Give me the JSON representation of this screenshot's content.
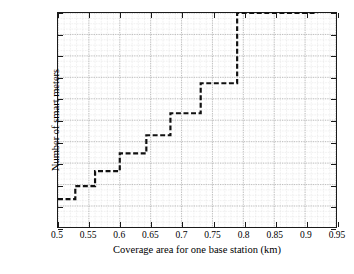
{
  "chart_data": {
    "type": "line",
    "subtype": "step",
    "title": "",
    "xlabel": "Coverage area for one base station (km)",
    "ylabel": "Number of smart meters",
    "xlim": [
      0.5,
      0.95
    ],
    "ylim": [
      600,
      2600
    ],
    "xticks": [
      0.5,
      0.55,
      0.6,
      0.65,
      0.7,
      0.75,
      0.8,
      0.85,
      0.9,
      0.95
    ],
    "xticklabels": [
      "0.5",
      "0.55",
      "0.6",
      "0.65",
      "0.7",
      "0.75",
      "0.8",
      "0.85",
      "0.9",
      "0.95"
    ],
    "yticks": [
      600,
      800,
      1000,
      1200,
      1400,
      1600,
      1800,
      2000,
      2200,
      2400,
      2600
    ],
    "yticklabels": [
      "600",
      "800",
      "1000",
      "1200",
      "1400",
      "1600",
      "1800",
      "2000",
      "2200",
      "2400",
      "2600"
    ],
    "grid": true,
    "grid_minor": true,
    "legend": "none",
    "line_style": "dashed",
    "line_color": "#111111",
    "line_width": 2.2,
    "steps": [
      {
        "x_start": 0.5,
        "x_end": 0.528,
        "y": 865
      },
      {
        "x_start": 0.528,
        "x_end": 0.56,
        "y": 985
      },
      {
        "x_start": 0.56,
        "x_end": 0.6,
        "y": 1125
      },
      {
        "x_start": 0.6,
        "x_end": 0.643,
        "y": 1290
      },
      {
        "x_start": 0.643,
        "x_end": 0.682,
        "y": 1460
      },
      {
        "x_start": 0.682,
        "x_end": 0.731,
        "y": 1665
      },
      {
        "x_start": 0.731,
        "x_end": 0.79,
        "y": 1945
      },
      {
        "x_start": 0.79,
        "x_end": 0.92,
        "y": 2600
      }
    ],
    "x": [
      0.5,
      0.528,
      0.56,
      0.6,
      0.643,
      0.682,
      0.731,
      0.79,
      0.92
    ],
    "values": [
      865,
      985,
      1125,
      1290,
      1460,
      1665,
      1945,
      2600,
      2600
    ]
  }
}
